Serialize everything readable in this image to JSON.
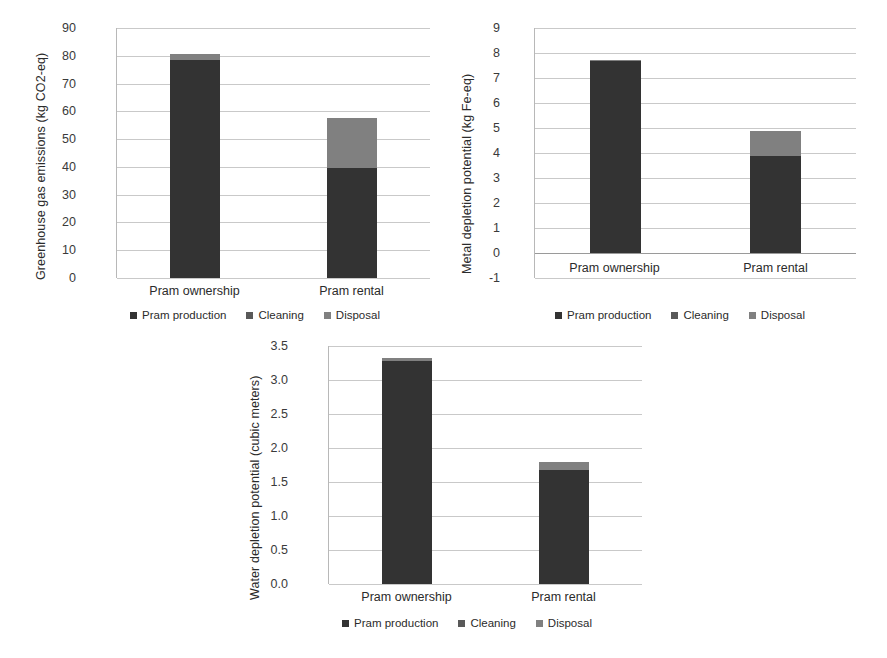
{
  "figure": {
    "background": "#ffffff",
    "series_colors": {
      "pram_production": "#333333",
      "cleaning": "#595959",
      "disposal": "#808080"
    }
  },
  "legend": {
    "items": [
      {
        "label": "Pram production",
        "color": "#333333"
      },
      {
        "label": "Cleaning",
        "color": "#595959"
      },
      {
        "label": "Disposal",
        "color": "#808080"
      }
    ]
  },
  "chart_data": [
    {
      "id": "ghg",
      "type": "bar",
      "stacked": true,
      "title": "",
      "xlabel": "",
      "ylabel": "Greenhouse gas emissions (kg CO2-eq)",
      "categories": [
        "Pram ownership",
        "Pram rental"
      ],
      "ylim": [
        0,
        90
      ],
      "yticks": [
        0,
        10,
        20,
        30,
        40,
        50,
        60,
        70,
        80,
        90
      ],
      "ytick_labels": [
        "0",
        "10",
        "20",
        "30",
        "40",
        "50",
        "60",
        "70",
        "80",
        "90"
      ],
      "grid": true,
      "legend_position": "bottom",
      "series": [
        {
          "name": "Pram production",
          "color": "#333333",
          "values": [
            78.5,
            39.7
          ]
        },
        {
          "name": "Cleaning",
          "color": "#595959",
          "values": [
            0,
            0
          ]
        },
        {
          "name": "Disposal",
          "color": "#808080",
          "values": [
            2.3,
            17.8
          ]
        }
      ],
      "totals": [
        80.8,
        57.5
      ]
    },
    {
      "id": "metal",
      "type": "bar",
      "stacked": true,
      "title": "",
      "xlabel": "",
      "ylabel": "Metal depletion potential (kg Fe-eq)",
      "categories": [
        "Pram ownership",
        "Pram rental"
      ],
      "ylim": [
        -1,
        9
      ],
      "yticks": [
        -1,
        0,
        1,
        2,
        3,
        4,
        5,
        6,
        7,
        8,
        9
      ],
      "ytick_labels": [
        "-1",
        "0",
        "1",
        "2",
        "3",
        "4",
        "5",
        "6",
        "7",
        "8",
        "9"
      ],
      "grid": true,
      "legend_position": "bottom",
      "series": [
        {
          "name": "Pram production",
          "color": "#333333",
          "values": [
            7.68,
            3.9
          ]
        },
        {
          "name": "Cleaning",
          "color": "#595959",
          "values": [
            0,
            0
          ]
        },
        {
          "name": "Disposal",
          "color": "#808080",
          "values": [
            0.05,
            1.0
          ]
        }
      ],
      "totals": [
        7.73,
        4.9
      ]
    },
    {
      "id": "water",
      "type": "bar",
      "stacked": true,
      "title": "",
      "xlabel": "",
      "ylabel": "Water depletion potential (cubic meters)",
      "categories": [
        "Pram ownership",
        "Pram rental"
      ],
      "ylim": [
        0,
        3.5
      ],
      "yticks": [
        0.0,
        0.5,
        1.0,
        1.5,
        2.0,
        2.5,
        3.0,
        3.5
      ],
      "ytick_labels": [
        "0.0",
        "0.5",
        "1.0",
        "1.5",
        "2.0",
        "2.5",
        "3.0",
        "3.5"
      ],
      "grid": true,
      "legend_position": "bottom",
      "series": [
        {
          "name": "Pram production",
          "color": "#333333",
          "values": [
            3.28,
            1.68
          ]
        },
        {
          "name": "Cleaning",
          "color": "#595959",
          "values": [
            0,
            0
          ]
        },
        {
          "name": "Disposal",
          "color": "#808080",
          "values": [
            0.04,
            0.11
          ]
        }
      ],
      "totals": [
        3.32,
        1.79
      ]
    }
  ]
}
